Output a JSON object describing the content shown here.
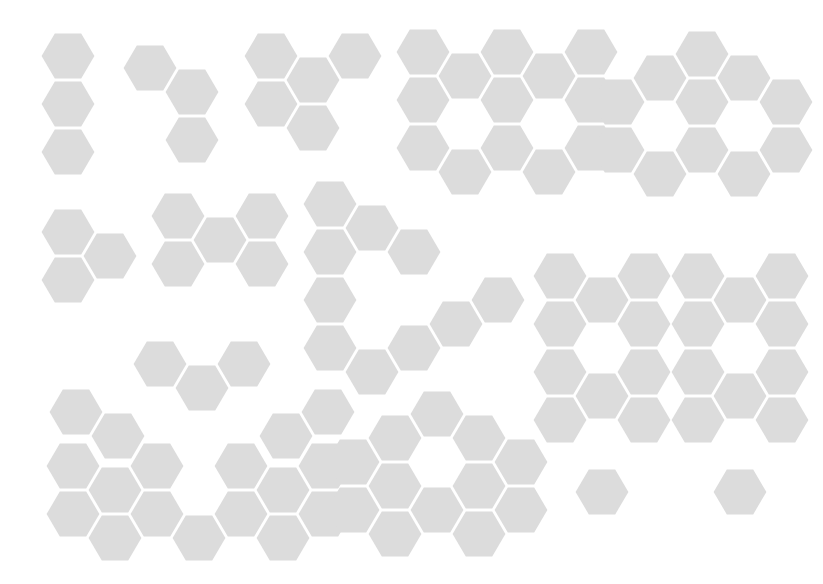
{
  "canvas": {
    "width": 823,
    "height": 584,
    "background": "#ffffff",
    "title": "Hexagonal Polyomino Shape Set"
  },
  "geometry": {
    "hex_width": 56,
    "hex_height": 48,
    "col_step": 42,
    "row_step": 48,
    "row_offset": 24,
    "inset": 1.6,
    "orientation": "flat-top",
    "note": "Axial offset grid: x = origin_x + col*col_step, y = origin_y + row*row_step + (col odd ? row_offset : 0)"
  },
  "style": {
    "hex_fill": "#dcdcdc",
    "hex_stroke": "none",
    "gap_color": "#ffffff"
  },
  "shapes": [
    {
      "id": "shape-1",
      "name": "vertical-triomino",
      "label": "I-tromino column",
      "count": 3,
      "origin": {
        "x": 40,
        "y": 32
      },
      "cells": [
        [
          0,
          0
        ],
        [
          0,
          1
        ],
        [
          0,
          2
        ]
      ]
    },
    {
      "id": "shape-2",
      "name": "triangle-triomino",
      "label": "Y-shaped trihex",
      "count": 3,
      "origin": {
        "x": 122,
        "y": 44
      },
      "cells": [
        [
          0,
          0
        ],
        [
          1,
          0
        ],
        [
          1,
          1
        ]
      ]
    },
    {
      "id": "shape-3",
      "name": "stair-pentahex",
      "label": "Stepped five-hex cluster",
      "count": 5,
      "origin": {
        "x": 243,
        "y": 32
      },
      "cells": [
        [
          0,
          0
        ],
        [
          0,
          1
        ],
        [
          1,
          0
        ],
        [
          1,
          1
        ],
        [
          2,
          0
        ]
      ]
    },
    {
      "id": "shape-4",
      "name": "double-ring-wide",
      "label": "Wide double-loop block",
      "count": 14,
      "origin": {
        "x": 395,
        "y": 28
      },
      "cells": [
        [
          0,
          0
        ],
        [
          0,
          1
        ],
        [
          0,
          2
        ],
        [
          1,
          0
        ],
        [
          1,
          2
        ],
        [
          2,
          0
        ],
        [
          2,
          1
        ],
        [
          2,
          2
        ],
        [
          3,
          0
        ],
        [
          3,
          2
        ],
        [
          4,
          0
        ],
        [
          4,
          1
        ],
        [
          4,
          2
        ]
      ]
    },
    {
      "id": "shape-5",
      "name": "hex-ring-large",
      "label": "Large hexagonal ring",
      "count": 12,
      "origin": {
        "x": 590,
        "y": 30
      },
      "cells": [
        [
          0,
          1
        ],
        [
          0,
          2
        ],
        [
          1,
          0
        ],
        [
          1,
          2
        ],
        [
          2,
          0
        ],
        [
          2,
          1
        ],
        [
          2,
          2
        ],
        [
          3,
          0
        ],
        [
          3,
          2
        ],
        [
          4,
          1
        ],
        [
          4,
          2
        ]
      ]
    },
    {
      "id": "shape-6",
      "name": "triangle-triomino-left",
      "label": "Three-hex wedge",
      "count": 3,
      "origin": {
        "x": 40,
        "y": 208
      },
      "cells": [
        [
          0,
          0
        ],
        [
          0,
          1
        ],
        [
          1,
          0
        ]
      ]
    },
    {
      "id": "shape-7",
      "name": "zigzag-hexahex",
      "label": "Zigzag six-hex bar",
      "count": 6,
      "origin": {
        "x": 150,
        "y": 192
      },
      "cells": [
        [
          0,
          0
        ],
        [
          0,
          1
        ],
        [
          1,
          0
        ],
        [
          2,
          0
        ],
        [
          2,
          1
        ]
      ]
    },
    {
      "id": "shape-8",
      "name": "triangle-ring",
      "label": "Triangular outline ring",
      "count": 12,
      "origin": {
        "x": 302,
        "y": 180
      },
      "cells": [
        [
          0,
          0
        ],
        [
          0,
          1
        ],
        [
          0,
          2
        ],
        [
          0,
          3
        ],
        [
          1,
          0
        ],
        [
          1,
          3
        ],
        [
          2,
          1
        ],
        [
          2,
          3
        ],
        [
          3,
          2
        ],
        [
          4,
          2
        ]
      ]
    },
    {
      "id": "shape-9",
      "name": "tall-ring-left",
      "label": "Tall twin-hole column left",
      "count": 16,
      "origin": {
        "x": 532,
        "y": 252
      },
      "cells": [
        [
          0,
          0
        ],
        [
          0,
          1
        ],
        [
          0,
          2
        ],
        [
          0,
          3
        ],
        [
          1,
          0
        ],
        [
          1,
          2
        ],
        [
          1,
          4
        ],
        [
          2,
          0
        ],
        [
          2,
          1
        ],
        [
          2,
          2
        ],
        [
          2,
          3
        ]
      ]
    },
    {
      "id": "shape-10",
      "name": "tall-ring-right",
      "label": "Tall twin-hole column right",
      "count": 16,
      "origin": {
        "x": 670,
        "y": 252
      },
      "cells": [
        [
          0,
          0
        ],
        [
          0,
          1
        ],
        [
          0,
          2
        ],
        [
          0,
          3
        ],
        [
          1,
          0
        ],
        [
          1,
          2
        ],
        [
          1,
          4
        ],
        [
          2,
          0
        ],
        [
          2,
          1
        ],
        [
          2,
          2
        ],
        [
          2,
          3
        ]
      ]
    },
    {
      "id": "shape-11",
      "name": "arch-heptahex",
      "label": "Arch of seven hexes",
      "count": 7,
      "origin": {
        "x": 48,
        "y": 340
      },
      "cells": [
        [
          0,
          1
        ],
        [
          1,
          1
        ],
        [
          2,
          0
        ],
        [
          3,
          0
        ],
        [
          4,
          0
        ],
        [
          5,
          1
        ],
        [
          6,
          1
        ]
      ]
    },
    {
      "id": "shape-12",
      "name": "double-loop-bowtie",
      "label": "Bow-tie of two rings",
      "count": 13,
      "origin": {
        "x": 45,
        "y": 442
      },
      "cells": [
        [
          0,
          0
        ],
        [
          0,
          1
        ],
        [
          1,
          0
        ],
        [
          1,
          1
        ],
        [
          2,
          0
        ],
        [
          2,
          1
        ],
        [
          3,
          1
        ],
        [
          4,
          0
        ],
        [
          4,
          1
        ],
        [
          5,
          0
        ],
        [
          5,
          1
        ],
        [
          6,
          0
        ],
        [
          6,
          1
        ]
      ]
    },
    {
      "id": "shape-13",
      "name": "triangle-cluster-bottom",
      "label": "Triangular cluster with holes",
      "count": 13,
      "origin": {
        "x": 325,
        "y": 390
      },
      "cells": [
        [
          0,
          1
        ],
        [
          0,
          2
        ],
        [
          1,
          0
        ],
        [
          1,
          1
        ],
        [
          1,
          2
        ],
        [
          2,
          0
        ],
        [
          2,
          2
        ],
        [
          3,
          0
        ],
        [
          3,
          1
        ],
        [
          3,
          2
        ],
        [
          4,
          1
        ],
        [
          4,
          2
        ]
      ]
    }
  ]
}
